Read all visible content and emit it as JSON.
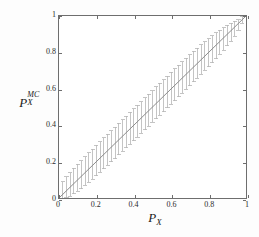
{
  "figure": {
    "background_color": "#fdfdfd",
    "plot_background_color": "#ffffff",
    "axis_color": "#6e6e6e"
  },
  "chart_data": {
    "type": "scatter",
    "title": "",
    "subtitle": "",
    "xlabel": "P_X",
    "xlabel_base": "P",
    "xlabel_sub": "X",
    "ylabel": "P_X^MC",
    "ylabel_base": "P",
    "ylabel_sub": "X",
    "ylabel_sup": "MC",
    "xlim": [
      0,
      1
    ],
    "ylim": [
      0,
      1
    ],
    "xticks": [
      0,
      0.2,
      0.4,
      0.6,
      0.8,
      1
    ],
    "yticks": [
      0,
      0.2,
      0.4,
      0.6,
      0.8,
      1
    ],
    "xticklabels": [
      "0",
      "0.2",
      "0.4",
      "0.6",
      "0.8",
      "1"
    ],
    "yticklabels": [
      "0",
      "0.2",
      "0.4",
      "0.6",
      "0.8",
      "1"
    ],
    "grid": false,
    "legend": null,
    "series": [
      {
        "name": "reference-line",
        "type": "line",
        "color": "#8a8a8a",
        "linewidth": 1.0,
        "x": [
          0,
          1
        ],
        "values": [
          0,
          1
        ]
      },
      {
        "name": "monte-carlo-errorbars",
        "type": "errorbar",
        "color": "#b4b4b4",
        "linewidth": 0.8,
        "cap_width": 0.011,
        "x": [
          0.02,
          0.04,
          0.06,
          0.08,
          0.1,
          0.12,
          0.14,
          0.16,
          0.18,
          0.2,
          0.22,
          0.24,
          0.26,
          0.28,
          0.3,
          0.32,
          0.34,
          0.36,
          0.38,
          0.4,
          0.42,
          0.44,
          0.46,
          0.48,
          0.5,
          0.52,
          0.54,
          0.56,
          0.58,
          0.6,
          0.62,
          0.64,
          0.66,
          0.68,
          0.7,
          0.72,
          0.74,
          0.76,
          0.78,
          0.8,
          0.82,
          0.84,
          0.86,
          0.88,
          0.9,
          0.92,
          0.94,
          0.96,
          0.98
        ],
        "values": [
          0.02,
          0.04,
          0.06,
          0.08,
          0.1,
          0.12,
          0.14,
          0.16,
          0.18,
          0.2,
          0.22,
          0.24,
          0.26,
          0.28,
          0.3,
          0.32,
          0.34,
          0.36,
          0.38,
          0.4,
          0.42,
          0.44,
          0.46,
          0.48,
          0.5,
          0.52,
          0.54,
          0.56,
          0.58,
          0.6,
          0.62,
          0.64,
          0.66,
          0.68,
          0.7,
          0.72,
          0.74,
          0.76,
          0.78,
          0.8,
          0.82,
          0.84,
          0.86,
          0.88,
          0.9,
          0.92,
          0.94,
          0.96,
          0.98
        ],
        "err_low": [
          0.02,
          0.038,
          0.05,
          0.058,
          0.064,
          0.068,
          0.071,
          0.074,
          0.076,
          0.078,
          0.079,
          0.08,
          0.081,
          0.082,
          0.083,
          0.083,
          0.084,
          0.084,
          0.085,
          0.085,
          0.085,
          0.085,
          0.085,
          0.085,
          0.085,
          0.085,
          0.085,
          0.085,
          0.085,
          0.085,
          0.085,
          0.084,
          0.084,
          0.083,
          0.083,
          0.082,
          0.081,
          0.08,
          0.079,
          0.078,
          0.076,
          0.074,
          0.071,
          0.068,
          0.064,
          0.058,
          0.05,
          0.038,
          0.02
        ],
        "err_high": [
          0.068,
          0.076,
          0.08,
          0.083,
          0.085,
          0.086,
          0.087,
          0.088,
          0.089,
          0.089,
          0.09,
          0.09,
          0.09,
          0.09,
          0.09,
          0.09,
          0.09,
          0.09,
          0.09,
          0.09,
          0.09,
          0.09,
          0.09,
          0.09,
          0.09,
          0.09,
          0.09,
          0.09,
          0.09,
          0.09,
          0.089,
          0.089,
          0.088,
          0.087,
          0.086,
          0.085,
          0.083,
          0.081,
          0.078,
          0.075,
          0.071,
          0.067,
          0.062,
          0.056,
          0.049,
          0.041,
          0.031,
          0.02,
          0.019
        ]
      }
    ]
  }
}
